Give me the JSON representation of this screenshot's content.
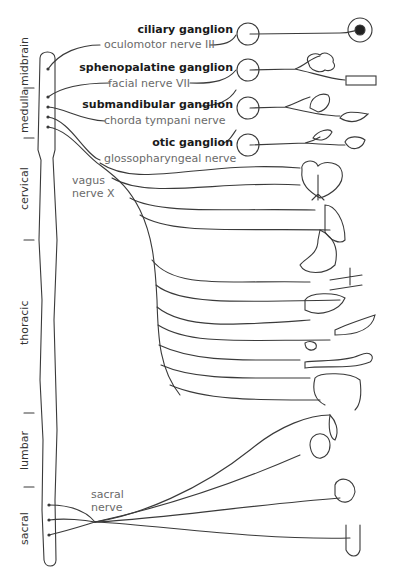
{
  "diagram": {
    "regions": [
      {
        "id": "midbrain",
        "label": "midbrain"
      },
      {
        "id": "medulla",
        "label": "medulla"
      },
      {
        "id": "cervical",
        "label": "cervical"
      },
      {
        "id": "thoracic",
        "label": "thoracic"
      },
      {
        "id": "lumbar",
        "label": "lumbar"
      },
      {
        "id": "sacral",
        "label": "sacral"
      }
    ],
    "ganglia": [
      {
        "label": "ciliary ganglion",
        "nerve": "oculomotor nerve III",
        "target": "eye"
      },
      {
        "label": "sphenopalatine ganglion",
        "nerve": "facial nerve VII",
        "target": "lacrimal gland / nasal mucosa"
      },
      {
        "label": "submandibular ganglion",
        "nerve": "chorda tympani nerve",
        "target": "submandibular & sublingual glands"
      },
      {
        "label": "otic ganglion",
        "nerve": "glossopharyngeal nerve",
        "target": "parotid gland"
      }
    ],
    "vagus": {
      "label_line1": "vagus",
      "label_line2": "nerve X"
    },
    "sacral": {
      "label_line1": "sacral",
      "label_line2": "nerve"
    },
    "vagus_targets": [
      "heart",
      "trachea/bronchi",
      "lung",
      "stomach",
      "blood vessels",
      "liver",
      "pancreas",
      "gallbladder",
      "small intestine",
      "colon"
    ],
    "sacral_targets": [
      "rectum",
      "kidney",
      "bladder",
      "genitals"
    ],
    "colors": {
      "line": "#3a3a3a",
      "ganglion_text": "#1a1a1a",
      "nerve_text": "#6a6a6a",
      "background": "#ffffff"
    }
  }
}
